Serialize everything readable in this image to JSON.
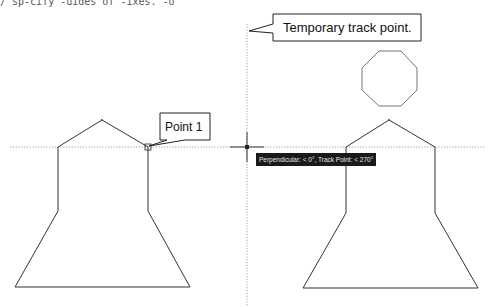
{
  "top_clipped_text": "/ sp-cify  -uides of -ixes. -o",
  "callouts": {
    "track_point": "Temporary track point.",
    "point1": "Point 1"
  },
  "tooltip": {
    "text": "Perpendicular: < 0°,  Track Point: < 270°"
  },
  "colors": {
    "shape_stroke": "#333333",
    "octagon_stroke": "#777777",
    "tracking_line": "#888888",
    "tooltip_bg": "#1a1a1a",
    "tooltip_fg": "#e8e8e8"
  },
  "geometry": {
    "horizontal_tracking_y": 147,
    "vertical_tracking_x": 247,
    "crosshair": [
      247,
      147
    ]
  }
}
